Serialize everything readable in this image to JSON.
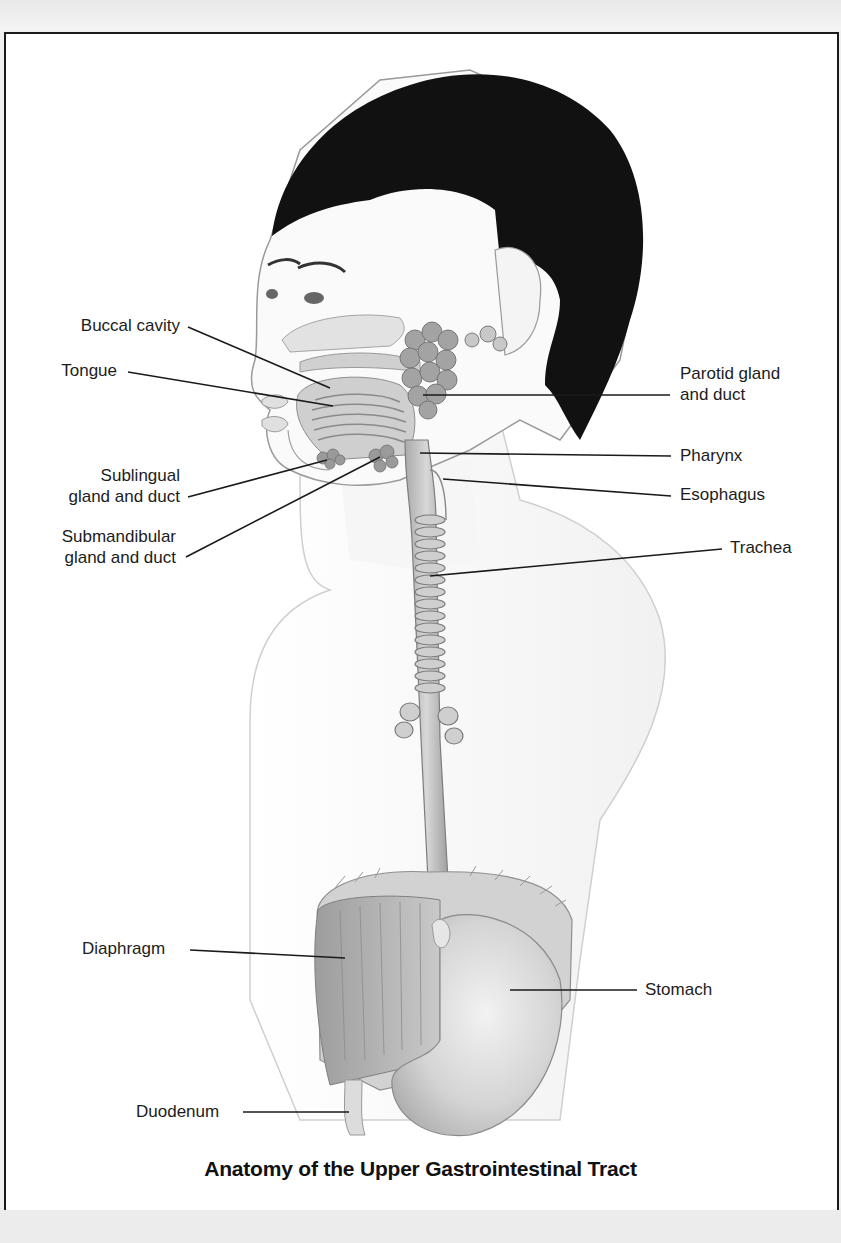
{
  "figure": {
    "title": "Anatomy of the Upper Gastrointestinal Tract",
    "labels": {
      "buccal_cavity": "Buccal cavity",
      "tongue": "Tongue",
      "sublingual_line1": "Sublingual",
      "sublingual_line2": "gland and duct",
      "submandibular_line1": "Submandibular",
      "submandibular_line2": "gland and duct",
      "parotid_line1": "Parotid gland",
      "parotid_line2": "and duct",
      "pharynx": "Pharynx",
      "esophagus": "Esophagus",
      "trachea": "Trachea",
      "diaphragm": "Diaphragm",
      "stomach": "Stomach",
      "duodenum": "Duodenum"
    },
    "colors": {
      "hair": "#111111",
      "skin_outline": "#9a9a9a",
      "organ_fill": "#bdbdbd",
      "leader_line": "#1a1a1a",
      "frame": "#1a1a1a"
    }
  }
}
